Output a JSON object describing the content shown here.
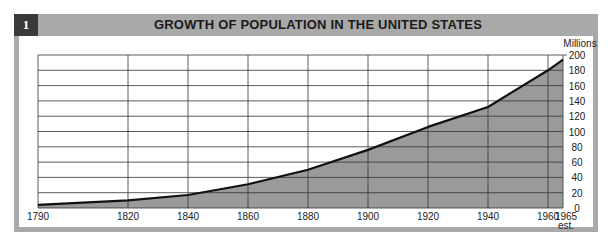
{
  "header": {
    "figure_number": "1",
    "title": "GROWTH OF POPULATION IN THE UNITED STATES"
  },
  "colors": {
    "frame": "#a9a9a9",
    "badge": "#3a3a3a",
    "fill": "#9a9a9a",
    "line": "#111111",
    "grid": "#333333"
  },
  "chart_data": {
    "type": "area",
    "title": "GROWTH OF POPULATION IN THE UNITED STATES",
    "xlabel": "",
    "ylabel": "Millions",
    "x": [
      1790,
      1820,
      1840,
      1860,
      1880,
      1900,
      1920,
      1940,
      1960,
      1965
    ],
    "x_tick_labels": [
      "1790",
      "1820",
      "1840",
      "1860",
      "1880",
      "1900",
      "1920",
      "1940",
      "1960",
      "1965 est."
    ],
    "series": [
      {
        "name": "Population (millions)",
        "values": [
          4,
          10,
          17,
          31,
          50,
          76,
          106,
          132,
          180,
          194
        ]
      }
    ],
    "y_ticks": [
      0,
      20,
      40,
      60,
      80,
      100,
      120,
      140,
      160,
      180,
      200
    ],
    "ylim": [
      0,
      200
    ],
    "xlim": [
      1790,
      1965
    ],
    "y_axis_position": "right",
    "grid": true,
    "legend": "none",
    "annotations": [
      "est."
    ]
  }
}
